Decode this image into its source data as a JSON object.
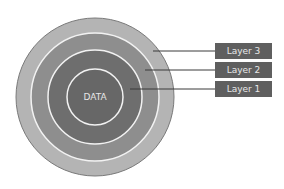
{
  "diagram": {
    "center_label": "DATA",
    "layers": [
      {
        "label": "Layer 3",
        "color": "#b4b4b4"
      },
      {
        "label": "Layer 2",
        "color": "#8e8e8e"
      },
      {
        "label": "Layer 1",
        "color": "#6e6e6e"
      }
    ],
    "core_color": "#676767",
    "label_box_color": "#5f5f5f"
  }
}
